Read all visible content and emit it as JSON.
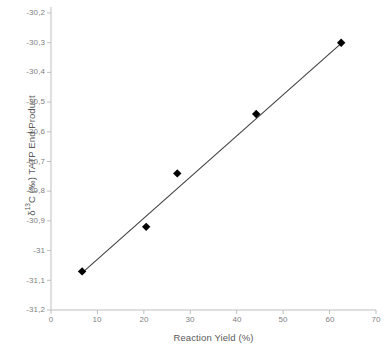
{
  "chart_data": {
    "type": "scatter",
    "title": "",
    "xlabel": "Reaction Yield (%)",
    "ylabel_parts": {
      "delta": "δ",
      "superscript": "13",
      "rest": "C (‰) TATP End Product"
    },
    "ylabel": "δ13C (‰) TATP End Product",
    "xlim": [
      0,
      70
    ],
    "ylim": [
      -31.2,
      -30.2
    ],
    "xticks": [
      "0",
      "10",
      "20",
      "30",
      "40",
      "50",
      "60",
      "70"
    ],
    "xtick_values": [
      0,
      10,
      20,
      30,
      40,
      50,
      60,
      70
    ],
    "yticks": [
      "-30,2",
      "-30,3",
      "-30,4",
      "-30,5",
      "-30,6",
      "-30,7",
      "-30,8",
      "-30,9",
      "-31",
      "-31,1",
      "-31,2"
    ],
    "ytick_values": [
      -30.2,
      -30.3,
      -30.4,
      -30.5,
      -30.6,
      -30.7,
      -30.8,
      -30.9,
      -31.0,
      -31.1,
      -31.2
    ],
    "grid": false,
    "legend": "none",
    "series": [
      {
        "name": "TATP End Product",
        "marker": "diamond",
        "marker_color": "#000000",
        "x": [
          6.7,
          20.5,
          27.2,
          44.2,
          62.5
        ],
        "y": [
          -31.07,
          -30.92,
          -30.74,
          -30.54,
          -30.3
        ]
      }
    ],
    "trendline": {
      "name": "linear fit",
      "color": "#404040",
      "x_start": 6.7,
      "y_start": -31.075,
      "x_end": 62.5,
      "y_end": -30.302
    },
    "colors": {
      "axis": "#bfbfbf",
      "tick_text": "#7f7f7f",
      "title_text": "#595959",
      "marker": "#000000",
      "line": "#404040"
    }
  }
}
